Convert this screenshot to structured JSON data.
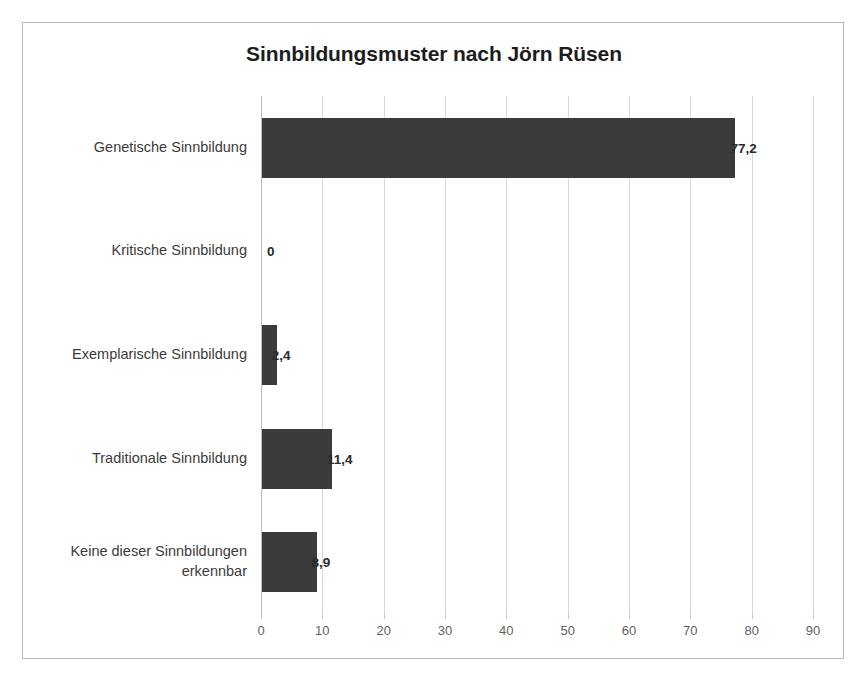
{
  "chart_data": {
    "type": "bar",
    "orientation": "horizontal",
    "title": "Sinnbildungsmuster nach Jörn Rüsen",
    "xlabel": "",
    "ylabel": "",
    "xlim": [
      0,
      90
    ],
    "xtick_step": 10,
    "grid": true,
    "legend": false,
    "bar_color": "#3b3b3b",
    "categories": [
      "Genetische Sinnbildung",
      "Kritische Sinnbildung",
      "Exemplarische Sinnbildung",
      "Traditionale Sinnbildung",
      "Keine dieser Sinnbildungen\nerkennbar"
    ],
    "values": [
      77.2,
      0,
      2.4,
      11.4,
      8.9
    ],
    "value_labels": [
      "77,2",
      "0",
      "2,4",
      "11,4",
      "8,9"
    ],
    "xticks": [
      0,
      10,
      20,
      30,
      40,
      50,
      60,
      70,
      80,
      90
    ],
    "xtick_labels": [
      "0",
      "10",
      "20",
      "30",
      "40",
      "50",
      "60",
      "70",
      "80",
      "90"
    ]
  }
}
